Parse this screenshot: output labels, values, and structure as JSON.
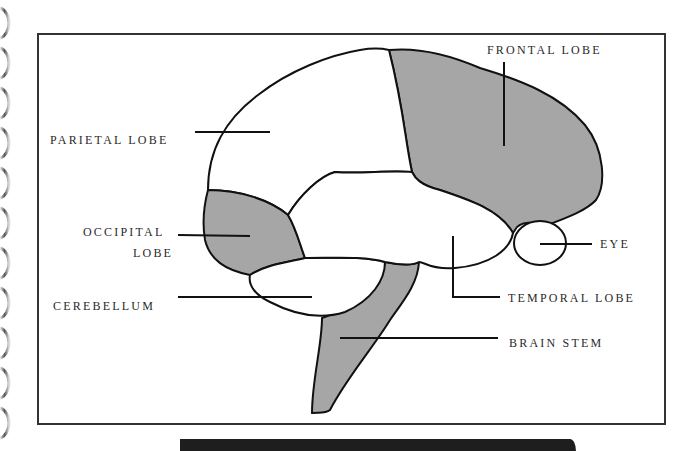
{
  "diagram": {
    "type": "labeled brain anatomy diagram (lateral view)",
    "colors": {
      "frame": "#333333",
      "outline": "#111111",
      "shaded_region": "#a6a6a6",
      "unshaded_region": "#ffffff",
      "label_text": "#2a2a2a",
      "bottom_bar": "#1e1e1e"
    },
    "labels": {
      "frontal_lobe": "FRONTAL LOBE",
      "parietal_lobe": "PARIETAL LOBE",
      "occipital_lobe_line1": "OCCIPITAL",
      "occipital_lobe_line2": "LOBE",
      "eye": "EYE",
      "cerebellum": "CEREBELLUM",
      "temporal_lobe": "TEMPORAL LOBE",
      "brain_stem": "BRAIN STEM"
    },
    "regions": [
      {
        "name": "frontal lobe",
        "shaded": true
      },
      {
        "name": "parietal lobe",
        "shaded": false
      },
      {
        "name": "occipital lobe",
        "shaded": true
      },
      {
        "name": "temporal lobe",
        "shaded": false
      },
      {
        "name": "cerebellum",
        "shaded": false
      },
      {
        "name": "brain stem",
        "shaded": true
      },
      {
        "name": "eye",
        "shaded": false
      }
    ]
  }
}
